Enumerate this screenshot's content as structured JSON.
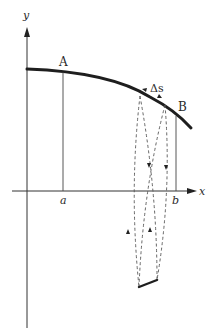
{
  "figure": {
    "type": "line-integral-diagram",
    "axes": {
      "x_label": "x",
      "y_label": "y"
    },
    "points": {
      "start_label": "A",
      "end_label": "B"
    },
    "interval": {
      "lower_label": "a",
      "upper_label": "b"
    },
    "arc_element_label": "Δs",
    "colors": {
      "ink": "#222222",
      "thin_line": "#444444",
      "background": "#ffffff"
    }
  }
}
